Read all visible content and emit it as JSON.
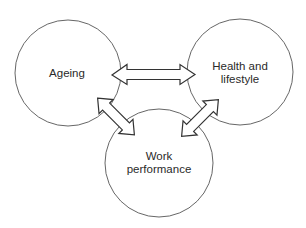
{
  "diagram": {
    "type": "relationship-diagram",
    "nodes": [
      {
        "id": "ageing",
        "label_lines": [
          "Ageing"
        ],
        "cx": 68,
        "cy": 73,
        "r": 53
      },
      {
        "id": "health",
        "label_lines": [
          "Health and",
          "lifestyle"
        ],
        "cx": 240,
        "cy": 72,
        "r": 53
      },
      {
        "id": "work",
        "label_lines": [
          "Work",
          "performance"
        ],
        "cx": 159,
        "cy": 163,
        "r": 54
      }
    ],
    "edges": [
      {
        "from": "ageing",
        "to": "health",
        "kind": "bidirectional"
      },
      {
        "from": "ageing",
        "to": "work",
        "kind": "bidirectional"
      },
      {
        "from": "health",
        "to": "work",
        "kind": "bidirectional"
      }
    ],
    "colors": {
      "background": "#ffffff",
      "stroke": "#333333",
      "text": "#2a2a2a"
    }
  },
  "labels": {
    "ageing": "Ageing",
    "health_line1": "Health and",
    "health_line2": "lifestyle",
    "work_line1": "Work",
    "work_line2": "performance"
  }
}
